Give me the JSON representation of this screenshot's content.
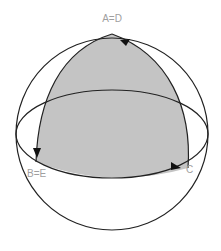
{
  "diagram": {
    "type": "spherical-triangle",
    "labels": {
      "top": "A=D",
      "left": "B=E",
      "right": "C"
    },
    "colors": {
      "fill": "#c4c4c4",
      "stroke": "#222222",
      "label": "#a0a0a0",
      "background": "#ffffff"
    }
  }
}
